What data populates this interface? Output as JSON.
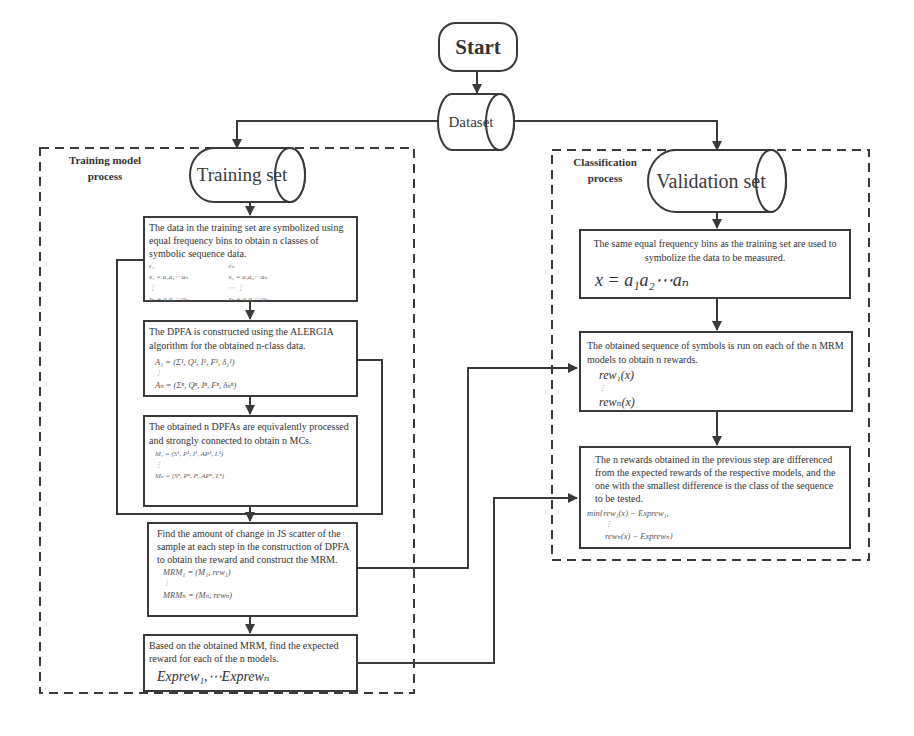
{
  "start": {
    "label": "Start"
  },
  "dataset": {
    "label": "Dataset"
  },
  "training": {
    "group_label_line1": "Training model",
    "group_label_line2": "process",
    "set_label": "Training set",
    "steps": [
      {
        "text": "The data in the training set are symbolized using equal frequency bins to obtain n classes of symbolic sequence data.",
        "math": {
          "c1": "c₁",
          "cn": "cₙ",
          "row1_left": "x₁ = a₁a₂⋯aₙ",
          "row1_right": "x₁ = a₁a₂⋯aₙ",
          "dots_left": "⋮",
          "dots_mid": "⋯ ⋮",
          "rown_left": "xₙ = a₁a₂⋯aₙ",
          "rown_right": "xₙ = a₁a₂⋯aₙ"
        }
      },
      {
        "text": "The DPFA is constructed using the ALERGIA algorithm for the obtained n-class data.",
        "math": {
          "first": "A₁ = (Σ¹, Q¹, I¹, F¹, δ₁¹)",
          "dots": "⋮",
          "last": "Aₙ = (Σⁿ, Qⁿ, Iⁿ, Fⁿ, δₙⁿ)"
        }
      },
      {
        "text": "The obtained n DPFAs are equivalently processed and strongly connected to obtain n MCs.",
        "math": {
          "first": "M₁ = (S¹, P¹, I¹, AP¹, L¹)",
          "dots": "⋮",
          "last": "Mₙ = (Sⁿ, Pⁿ, Iⁿ, APⁿ, Lⁿ)"
        }
      },
      {
        "text": "Find the amount of change in JS scatter of the sample at each step in the construction of DPFA to obtain the reward and construct the MRM.",
        "math": {
          "first": "MRM₁ = (M₁, rew₁)",
          "dots": "⋮",
          "last": "MRMₙ = (Mₙ, rewₙ)"
        }
      },
      {
        "text": "Based on the obtained MRM, find the expected reward for each of the n models.",
        "math": {
          "formula": "Exprew₁,⋯Exprewₙ"
        }
      }
    ]
  },
  "classification": {
    "group_label_line1": "Classification",
    "group_label_line2": "process",
    "set_label": "Validation set",
    "steps": [
      {
        "text": "The same equal frequency bins as the training set are used to symbolize the data to be measured.",
        "math": {
          "formula": "x = a₁a₂⋯aₙ"
        }
      },
      {
        "text": "The obtained sequence of symbols is run on each of the n MRM models to obtain n rewards.",
        "math": {
          "first": "rew₁(x)",
          "dots": "⋮",
          "last": "rewₙ(x)"
        }
      },
      {
        "text": "The n rewards obtained in the previous step are differenced from the expected rewards of the respective models, and the one with the smallest difference is the class of the sequence to be tested.",
        "math": {
          "first": "min{rew₁(x) − Exprew₁,",
          "dots": "⋮",
          "last": "rewₙ(x) − Exprewₙ}"
        }
      }
    ]
  },
  "colors": {
    "stroke": "#3a3a3a",
    "text": "#333333",
    "background": "#ffffff"
  }
}
